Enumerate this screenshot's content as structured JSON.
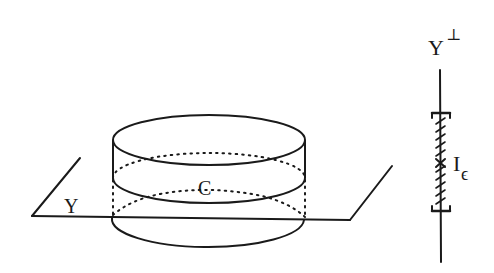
{
  "figure": {
    "left_panel": {
      "plane_label": "Y",
      "cylinder_label": "C"
    },
    "right_panel": {
      "axis_label": "Y",
      "axis_superscript": "⊥",
      "interval_label": "I",
      "interval_subscript": "ϵ"
    }
  },
  "colors": {
    "ink": "#1a1a1a",
    "background": "#ffffff"
  }
}
